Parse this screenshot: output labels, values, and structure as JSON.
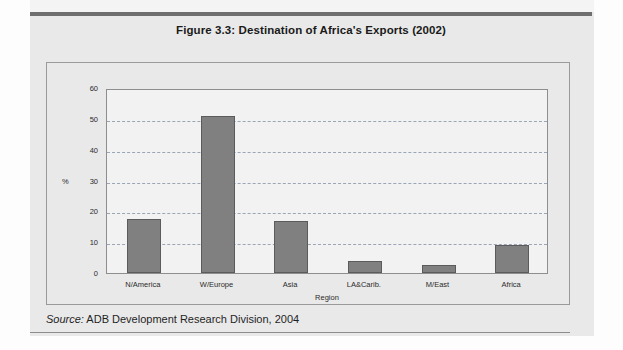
{
  "figure": {
    "title": "Figure 3.3:  Destination of Africa's Exports (2002)",
    "source_label": "Source:",
    "source_text": " ADB Development Research Division, 2004"
  },
  "colors": {
    "bar_fill": "#808080",
    "bar_stroke": "#5b5b5b",
    "gridline": "#9aa6b4",
    "plot_background": "#f2f2f2",
    "page_background": "#e9e9e9"
  },
  "chart_data": {
    "type": "bar",
    "title": "Figure 3.3:  Destination of Africa's Exports (2002)",
    "xlabel": "Region",
    "ylabel": "%",
    "categories": [
      "N/America",
      "W/Europe",
      "Asia",
      "LA&Carib.",
      "M/East",
      "Africa"
    ],
    "values": [
      17.5,
      51,
      17,
      4,
      2.5,
      9
    ],
    "ylim": [
      0,
      60
    ],
    "yticks": [
      0,
      10,
      20,
      30,
      40,
      50,
      60
    ],
    "ytick_labels": [
      "0",
      "10",
      "20",
      "30",
      "40",
      "50",
      "60"
    ],
    "grid": true,
    "legend": "none"
  }
}
